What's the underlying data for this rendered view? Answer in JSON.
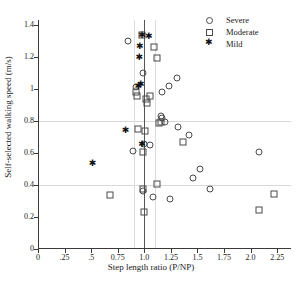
{
  "chart_data": {
    "type": "scatter",
    "title": "",
    "xlabel": "Step length ratio (P/NP)",
    "ylabel": "Self-selected walking speed (m/s)",
    "xlim": [
      0,
      2.38
    ],
    "ylim": [
      0,
      1.43
    ],
    "xticks": [
      0,
      0.25,
      0.5,
      0.75,
      1.0,
      1.25,
      1.5,
      1.75,
      2.0,
      2.25
    ],
    "xticklabels": [
      "0",
      ".25",
      ".5",
      "0.75",
      "1.0",
      "1.25",
      "1.5",
      "1.75",
      "2.0",
      "2.25"
    ],
    "yticks": [
      0,
      0.2,
      0.4,
      0.6,
      0.8,
      1.0,
      1.2,
      1.4
    ],
    "yticklabels": [
      "0",
      "0.2",
      "0.4",
      "0.6",
      "0.8",
      "1",
      "1.2",
      "1.4"
    ],
    "grid": false,
    "reference_lines": {
      "horizontal": [
        0.4,
        0.8
      ],
      "vertical_main": 1.0,
      "vertical_band": [
        0.9,
        1.1
      ]
    },
    "legend": {
      "position": "top-right",
      "entries": [
        {
          "label": "Severe",
          "marker": "circle"
        },
        {
          "label": "Moderate",
          "marker": "square"
        },
        {
          "label": "Mild",
          "marker": "asterisk"
        }
      ]
    },
    "series": [
      {
        "name": "Severe",
        "marker": "circle",
        "points": [
          [
            0.85,
            1.3
          ],
          [
            0.99,
            1.1
          ],
          [
            0.92,
            1.01
          ],
          [
            1.17,
            0.98
          ],
          [
            1.23,
            1.02
          ],
          [
            1.31,
            1.07
          ],
          [
            1.16,
            0.83
          ],
          [
            1.17,
            0.82
          ],
          [
            1.19,
            0.79
          ],
          [
            1.32,
            0.76
          ],
          [
            1.42,
            0.71
          ],
          [
            0.89,
            0.61
          ],
          [
            1.0,
            0.655
          ],
          [
            1.05,
            0.65
          ],
          [
            1.46,
            0.445
          ],
          [
            1.52,
            0.5
          ],
          [
            1.62,
            0.375
          ],
          [
            2.08,
            0.605
          ],
          [
            1.08,
            0.325
          ],
          [
            1.24,
            0.315
          ],
          [
            0.99,
            0.36
          ]
        ]
      },
      {
        "name": "Moderate",
        "marker": "square",
        "points": [
          [
            0.975,
            1.335
          ],
          [
            1.09,
            1.26
          ],
          [
            1.12,
            1.19
          ],
          [
            0.92,
            0.98
          ],
          [
            0.93,
            0.955
          ],
          [
            1.05,
            0.955
          ],
          [
            1.02,
            0.935
          ],
          [
            1.03,
            0.91
          ],
          [
            1.01,
            0.735
          ],
          [
            0.94,
            0.75
          ],
          [
            1.14,
            0.785
          ],
          [
            1.16,
            0.795
          ],
          [
            1.36,
            0.67
          ],
          [
            0.99,
            0.605
          ],
          [
            0.68,
            0.335
          ],
          [
            1.12,
            0.405
          ],
          [
            0.985,
            0.375
          ],
          [
            1.0,
            0.23
          ],
          [
            2.22,
            0.345
          ],
          [
            2.08,
            0.245
          ]
        ]
      },
      {
        "name": "Mild",
        "marker": "asterisk",
        "points": [
          [
            0.975,
            1.335
          ],
          [
            1.04,
            1.33
          ],
          [
            0.955,
            1.27
          ],
          [
            0.95,
            1.2
          ],
          [
            0.94,
            1.015
          ],
          [
            0.965,
            1.03
          ],
          [
            0.82,
            0.74
          ],
          [
            0.975,
            0.655
          ],
          [
            0.51,
            0.535
          ]
        ]
      }
    ]
  }
}
